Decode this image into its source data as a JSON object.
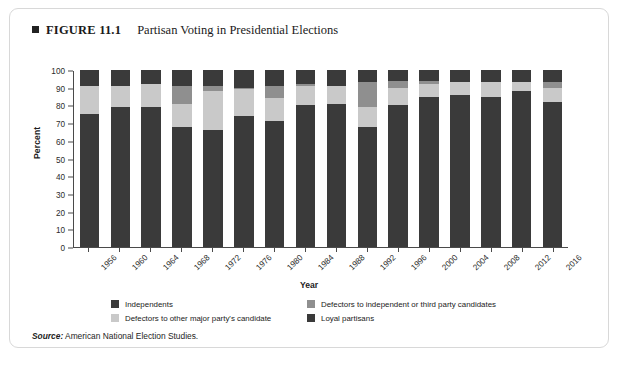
{
  "figure": {
    "number": "FIGURE 11.1",
    "title": "Partisan Voting in Presidential Elections",
    "source_word": "Source:",
    "source_text": " American National Election Studies."
  },
  "colors": {
    "loyal_partisans": "#3a3a3a",
    "defectors_other_major": "#c9c9c9",
    "defectors_third_party": "#8f8f8f",
    "independents": "#3a3a3a",
    "axis": "#4a4a4a",
    "card_border": "#d8d8d8",
    "background": "#ffffff"
  },
  "chart_data": {
    "type": "bar",
    "title": "Partisan Voting in Presidential Elections",
    "xlabel": "Year",
    "ylabel": "Percent",
    "ylim": [
      0,
      100
    ],
    "yticks": [
      0,
      10,
      20,
      30,
      40,
      50,
      60,
      70,
      80,
      90,
      100
    ],
    "grid": false,
    "stacked": true,
    "legend_position": "bottom",
    "categories": [
      "1956",
      "1960",
      "1964",
      "1968",
      "1972",
      "1976",
      "1980",
      "1984",
      "1988",
      "1992",
      "1996",
      "2000",
      "2004",
      "2008",
      "2012",
      "2016"
    ],
    "series": [
      {
        "name": "Loyal partisans",
        "color": "#3a3a3a",
        "values": [
          75,
          79,
          79,
          68,
          66,
          74,
          71,
          80,
          81,
          68,
          80,
          85,
          86,
          85,
          88,
          82
        ]
      },
      {
        "name": "Defectors to other major party's candidate",
        "color": "#c9c9c9",
        "values": [
          16,
          12,
          13,
          13,
          22,
          15,
          13,
          11,
          10,
          11,
          10,
          7,
          7,
          8,
          5,
          8
        ]
      },
      {
        "name": "Defectors to independent or third party candidates",
        "color": "#8f8f8f",
        "values": [
          0,
          0,
          0,
          10,
          3,
          1,
          7,
          1,
          0,
          14,
          4,
          2,
          0,
          0,
          0,
          3
        ]
      },
      {
        "name": "Independents",
        "color": "#3a3a3a",
        "values": [
          9,
          9,
          8,
          9,
          9,
          10,
          9,
          8,
          9,
          7,
          6,
          6,
          7,
          7,
          7,
          7
        ]
      }
    ]
  },
  "legend": {
    "items": [
      {
        "label": "Independents",
        "color": "#3a3a3a"
      },
      {
        "label": "Defectors to independent or third party candidates",
        "color": "#8f8f8f"
      },
      {
        "label": "Defectors to other major party's candidate",
        "color": "#c9c9c9"
      },
      {
        "label": "Loyal partisans",
        "color": "#3a3a3a"
      }
    ]
  }
}
